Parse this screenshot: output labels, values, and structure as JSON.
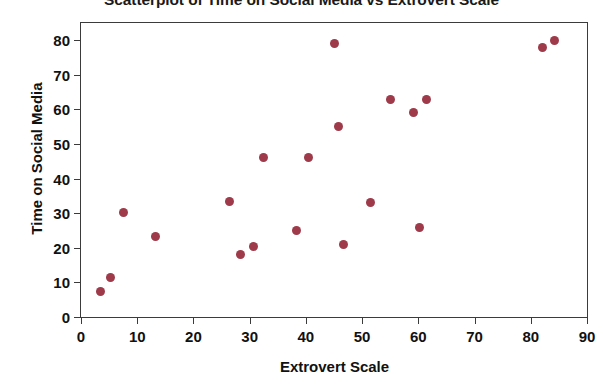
{
  "chart_data": {
    "type": "scatter",
    "title": "Scatterplot of Time on Social Media vs Extrovert Scale",
    "xlabel": "Extrovert Scale",
    "ylabel": "Time on Social Media",
    "xlim": [
      0,
      90
    ],
    "ylim": [
      0,
      85
    ],
    "xticks": [
      0,
      10,
      20,
      30,
      40,
      50,
      60,
      70,
      80,
      90
    ],
    "yticks": [
      0,
      10,
      20,
      30,
      40,
      50,
      60,
      70,
      80
    ],
    "xtick_labels": [
      "0",
      "10",
      "20",
      "30",
      "40",
      "50",
      "60",
      "70",
      "80",
      "90"
    ],
    "ytick_labels": [
      "0",
      "10",
      "20",
      "30",
      "40",
      "50",
      "60",
      "70",
      "80"
    ],
    "grid": false,
    "legend": "none",
    "marker_color": "#9e3a4a",
    "marker_shape": "circle",
    "series": [
      {
        "name": "Participants",
        "points": [
          {
            "x": 3.4,
            "y": 7.5
          },
          {
            "x": 5.2,
            "y": 11.5
          },
          {
            "x": 7.6,
            "y": 30.3
          },
          {
            "x": 13.3,
            "y": 23.4
          },
          {
            "x": 26.5,
            "y": 33.4
          },
          {
            "x": 28.3,
            "y": 18.2
          },
          {
            "x": 30.6,
            "y": 20.3
          },
          {
            "x": 32.4,
            "y": 46.0
          },
          {
            "x": 38.3,
            "y": 25.0
          },
          {
            "x": 40.5,
            "y": 46.0
          },
          {
            "x": 45.0,
            "y": 79.0
          },
          {
            "x": 45.8,
            "y": 55.0
          },
          {
            "x": 46.7,
            "y": 20.9
          },
          {
            "x": 51.5,
            "y": 33.0
          },
          {
            "x": 55.0,
            "y": 63.0
          },
          {
            "x": 59.2,
            "y": 59.0
          },
          {
            "x": 60.2,
            "y": 26.0
          },
          {
            "x": 61.4,
            "y": 63.0
          },
          {
            "x": 82.0,
            "y": 77.8
          },
          {
            "x": 84.2,
            "y": 80.0
          }
        ]
      }
    ]
  }
}
